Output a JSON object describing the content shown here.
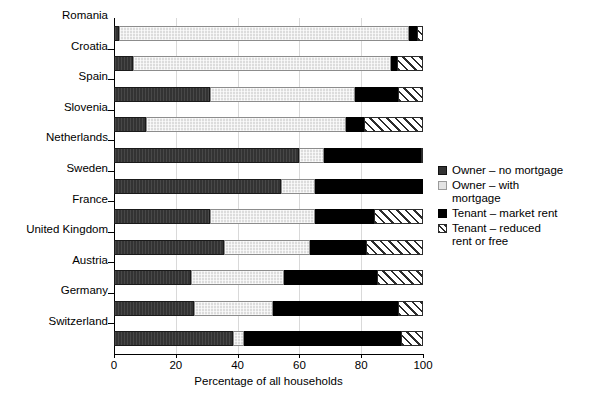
{
  "chart_data": {
    "type": "bar",
    "orientation": "horizontal",
    "stacked": true,
    "title": "",
    "xlabel": "Percentage of all households",
    "ylabel": "",
    "xlim": [
      0,
      100
    ],
    "xticks": [
      0,
      20,
      40,
      60,
      80,
      100
    ],
    "grid": "vertical-only",
    "legend_position": "right",
    "categories": [
      "Romania",
      "Croatia",
      "Spain",
      "Slovenia",
      "Netherlands",
      "Sweden",
      "France",
      "United Kingdom",
      "Austria",
      "Germany",
      "Switzerland"
    ],
    "series": [
      {
        "name": "Owner – no mortgage",
        "key": "owner-no",
        "color": "#333333",
        "values": [
          1.5,
          6.0,
          31.0,
          10.5,
          60.0,
          54.0,
          31.0,
          35.5,
          25.0,
          26.0,
          38.5
        ]
      },
      {
        "name": "Owner – with mortgage",
        "key": "owner-with",
        "color": "#dcdcdc",
        "values": [
          94.0,
          83.5,
          47.0,
          64.5,
          8.0,
          11.0,
          34.0,
          28.0,
          30.0,
          25.5,
          3.5
        ]
      },
      {
        "name": "Tenant – market rent",
        "key": "tenant-market",
        "color": "#000000",
        "values": [
          2.5,
          2.0,
          14.0,
          6.0,
          31.5,
          35.0,
          19.0,
          18.0,
          30.0,
          40.5,
          51.0
        ]
      },
      {
        "name": "Tenant – reduced rent or free",
        "key": "tenant-reduced",
        "color": "#ffffff",
        "hatch": "diagonal",
        "values": [
          2.0,
          8.5,
          8.0,
          19.0,
          0.5,
          0.0,
          16.0,
          18.5,
          15.0,
          8.0,
          7.0
        ]
      }
    ]
  },
  "legend": {
    "items": [
      {
        "label": "Owner – no mortgage",
        "swatch": "owner-no"
      },
      {
        "label": "Owner – with\nmortgage",
        "swatch": "owner-with"
      },
      {
        "label": "Tenant – market rent",
        "swatch": "tenant-market"
      },
      {
        "label": "Tenant – reduced\nrent or free",
        "swatch": "tenant-reduced"
      }
    ]
  },
  "axis": {
    "x_title": "Percentage of all households",
    "x_tick_labels": [
      "0",
      "20",
      "40",
      "60",
      "80",
      "100"
    ]
  }
}
